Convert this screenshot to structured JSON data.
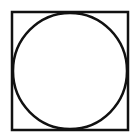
{
  "figure": {
    "stroke_color": "#111111",
    "background": "#ffffff",
    "square": {
      "x": 12,
      "y": 12,
      "width": 116,
      "height": 118,
      "stroke_width": 2.5
    },
    "circle": {
      "cx": 70,
      "cy": 71,
      "rx": 57,
      "ry": 58,
      "stroke_width": 2.5
    }
  }
}
